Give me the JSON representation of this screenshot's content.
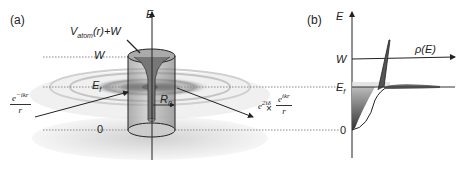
{
  "panel_a": {
    "label": "(a)",
    "axis_label": "E",
    "potential_label": "V",
    "potential_sub": "atom",
    "potential_rest": "(r)+W",
    "level_W": "W",
    "level_Ef": "E",
    "level_Ef_sub": "f",
    "level_zero": "0",
    "radius_label": "R",
    "radius_sub": "0",
    "incoming_wave": {
      "numerator": "e",
      "numerator_sup": "−ikr",
      "denominator": "r"
    },
    "outgoing_wave": {
      "phase": "e",
      "phase_sup": "2iδ",
      "times": "×",
      "numerator": "e",
      "numerator_sup": "ikr",
      "denominator": "r"
    }
  },
  "panel_b": {
    "label": "(b)",
    "axis_label": "E",
    "dos_label": "ρ(E)",
    "level_W": "W",
    "level_Ef": "E",
    "level_Ef_sub": "f",
    "level_zero": "0"
  },
  "colors": {
    "disk": "#dcdcdc",
    "cylinder": "#8a8a8a",
    "fill_dark": "#4a4a4a",
    "fill_light": "#cfcfcf",
    "line": "#222222"
  }
}
